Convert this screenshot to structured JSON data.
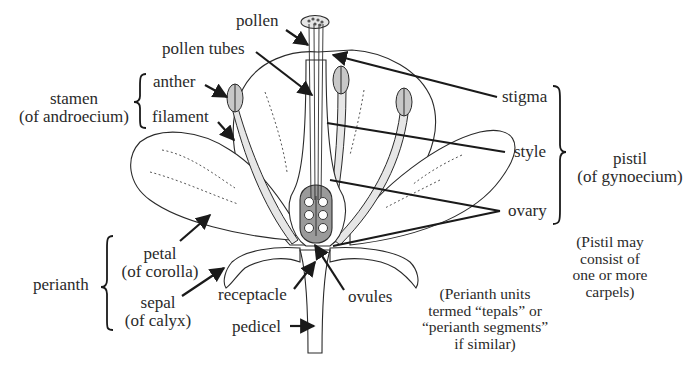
{
  "diagram": {
    "type": "flower-anatomy",
    "colors": {
      "line": "#2a2a2a",
      "fill_light": "#e6e6e6",
      "fill_mid": "#c8c8c8",
      "ovary_fill": "#9a9a9a",
      "background": "#ffffff"
    },
    "labels": {
      "pollen": "pollen",
      "pollen_tubes": "pollen tubes",
      "anther": "anther",
      "filament": "filament",
      "stamen": "stamen",
      "stamen_sub": "(of androecium)",
      "stigma": "stigma",
      "style": "style",
      "ovary": "ovary",
      "pistil": "pistil",
      "pistil_sub": "(of gynoecium)",
      "pistil_note": [
        "(Pistil may",
        "consist of",
        "one or more",
        "carpels)"
      ],
      "petal": "petal",
      "petal_sub": "(of corolla)",
      "perianth": "perianth",
      "sepal": "sepal",
      "sepal_sub": "(of calyx)",
      "receptacle": "receptacle",
      "ovules": "ovules",
      "pedicel": "pedicel",
      "perianth_note": [
        "(Perianth units",
        "termed “tepals” or",
        "“perianth segments”",
        "if similar)"
      ]
    },
    "groups": {
      "stamen": [
        "anther",
        "filament"
      ],
      "pistil": [
        "stigma",
        "style",
        "ovary"
      ],
      "perianth": [
        "petal",
        "sepal"
      ]
    }
  }
}
